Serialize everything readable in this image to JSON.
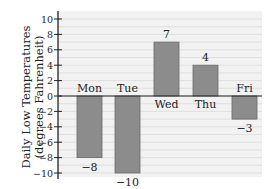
{
  "chart_data": {
    "type": "bar",
    "title": "",
    "xlabel": "",
    "ylabel": "Daily Low Temperatures (degrees Fahrenheit)",
    "ylabel_lines": [
      "Daily Low Temperatures",
      "(degrees Fahrenheit)"
    ],
    "categories": [
      "Mon",
      "Tue",
      "Wed",
      "Thu",
      "Fri"
    ],
    "values": [
      -8,
      -10,
      7,
      4,
      -3
    ],
    "data_labels": [
      "−8",
      "−10",
      "7",
      "4",
      "−3"
    ],
    "ylim": [
      -10,
      10
    ],
    "yticks": [
      10,
      8,
      6,
      4,
      2,
      0,
      -2,
      -4,
      -6,
      -8,
      -10
    ],
    "ytick_labels": [
      "10",
      "8",
      "6",
      "4",
      "2",
      "0",
      "−2",
      "−4",
      "−6",
      "−8",
      "−10"
    ],
    "grid": true,
    "legend": "none",
    "bar_color": "#8c8c8c",
    "plot_background": "#f2f2f2"
  }
}
